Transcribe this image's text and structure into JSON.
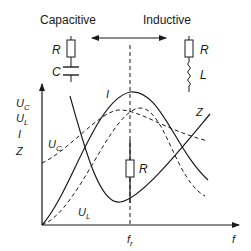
{
  "header": {
    "capacitive_label": "Capacitive",
    "inductive_label": "Inductive"
  },
  "circuits": {
    "rc": {
      "r_label": "R",
      "c_label": "C"
    },
    "rl": {
      "r_label": "R",
      "l_label": "L"
    },
    "resonance_r_label": "R"
  },
  "axes": {
    "y_labels": [
      {
        "main": "U",
        "sub": "C"
      },
      {
        "main": "U",
        "sub": "L"
      },
      {
        "main": "I",
        "sub": ""
      },
      {
        "main": "Z",
        "sub": ""
      }
    ],
    "x_label": "f",
    "resonance_label": {
      "main": "f",
      "sub": "r"
    }
  },
  "curves": {
    "I": {
      "label": "I",
      "style": "solid"
    },
    "Z": {
      "label": "Z",
      "style": "solid"
    },
    "UC": {
      "label": {
        "main": "U",
        "sub": "C"
      },
      "style": "dashed"
    },
    "UL": {
      "label": {
        "main": "U",
        "sub": "L"
      },
      "style": "dashed"
    }
  },
  "colors": {
    "line": "#1a1a1a",
    "background": "#ffffff"
  }
}
